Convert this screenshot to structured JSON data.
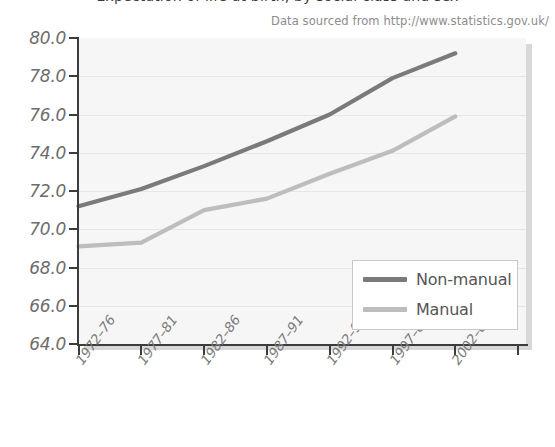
{
  "header": {
    "clipped_title": "Expectation of life at birth, by social class and sex",
    "source_note": "Data sourced from http://www.statistics.gov.uk/"
  },
  "legend": {
    "items": [
      {
        "label": "Non-manual",
        "color": "#7a7a7a"
      },
      {
        "label": "Manual",
        "color": "#bdbdbd"
      }
    ]
  },
  "chart_data": {
    "type": "line",
    "title": "",
    "xlabel": "",
    "ylabel": "",
    "categories": [
      "1972–76",
      "1977–81",
      "1982–86",
      "1987–91",
      "1992–96",
      "1997–01",
      "2002–05"
    ],
    "ylim": [
      64.0,
      80.0
    ],
    "ytick_step": 2.0,
    "ytick_labels": [
      "80.0",
      "78.0",
      "76.0",
      "74.0",
      "72.0",
      "70.0",
      "68.0",
      "66.0",
      "64.0"
    ],
    "ytick_values": [
      80.0,
      78.0,
      76.0,
      74.0,
      72.0,
      70.0,
      68.0,
      66.0,
      64.0
    ],
    "grid": true,
    "legend_position": "inside-bottom-right",
    "series": [
      {
        "name": "Non-manual",
        "color": "#7a7a7a",
        "values": [
          71.2,
          72.1,
          73.3,
          74.6,
          76.0,
          77.9,
          79.2
        ]
      },
      {
        "name": "Manual",
        "color": "#bdbdbd",
        "values": [
          69.1,
          69.3,
          71.0,
          71.6,
          72.9,
          74.1,
          75.9
        ]
      }
    ]
  }
}
